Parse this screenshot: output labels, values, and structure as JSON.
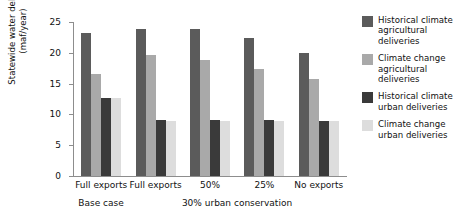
{
  "chart_data": {
    "type": "bar",
    "title": "",
    "xlabel": "",
    "ylabel": "Statewide water delivery (maf/year)",
    "ylabel_line1": "Statewide water delivery",
    "ylabel_line2": "(maf/year)",
    "ylim": [
      0,
      25
    ],
    "yticks": [
      0,
      5,
      10,
      15,
      20,
      25
    ],
    "ytick_labels": [
      "0",
      "5",
      "10",
      "15",
      "20",
      "25"
    ],
    "grid": false,
    "legend_position": "right",
    "categories": [
      "Full exports",
      "Full exports",
      "50%",
      "25%",
      "No exports"
    ],
    "super_categories": [
      {
        "label": "Base case",
        "span": 1
      },
      {
        "label": "30% urban conservation",
        "span": 4
      }
    ],
    "series": [
      {
        "name": "Historical climate agricultural deliveries",
        "color": "#5b5b5b",
        "values": [
          23.2,
          23.8,
          23.8,
          22.4,
          20.0
        ]
      },
      {
        "name": "Climate change agricultural deliveries",
        "color": "#a9a9a9",
        "values": [
          16.5,
          19.6,
          18.8,
          17.4,
          15.7
        ]
      },
      {
        "name": "Historical climate urban deliveries",
        "color": "#3a3a3a",
        "values": [
          12.7,
          9.1,
          9.1,
          9.1,
          9.0
        ]
      },
      {
        "name": "Climate change urban deliveries",
        "color": "#dddddd",
        "values": [
          12.7,
          9.0,
          9.0,
          8.9,
          8.9
        ]
      }
    ]
  },
  "legend": {
    "items": [
      {
        "label_line1": "Historical climate",
        "label_line2": "agricultural",
        "label_line3": "deliveries",
        "color": "#5b5b5b"
      },
      {
        "label_line1": "Climate change",
        "label_line2": "agricultural",
        "label_line3": "deliveries",
        "color": "#a9a9a9"
      },
      {
        "label_line1": "Historical climate",
        "label_line2": "urban deliveries",
        "label_line3": "",
        "color": "#3a3a3a"
      },
      {
        "label_line1": "Climate change",
        "label_line2": "urban deliveries",
        "label_line3": "",
        "color": "#dddddd"
      }
    ]
  },
  "colors": {
    "axis": "#8d8d8d",
    "text": "#111111",
    "background": "#ffffff"
  }
}
